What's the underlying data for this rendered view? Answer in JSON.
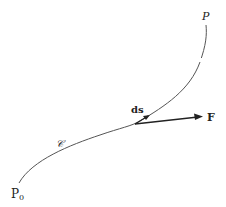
{
  "diagram": {
    "type": "line-integral-path",
    "labels": {
      "start_point": "P",
      "start_subscript": "0",
      "end_point": "P",
      "curve": "𝒞",
      "displacement": "ds",
      "force": "F"
    },
    "colors": {
      "curve": "#555555",
      "arrow": "#222222",
      "text": "#222222"
    }
  }
}
